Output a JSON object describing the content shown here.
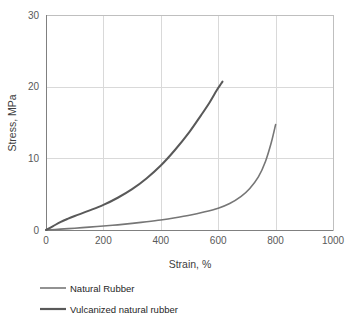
{
  "chart_data": {
    "type": "line",
    "title": "",
    "xlabel": "Strain, %",
    "ylabel": "Stress, MPa",
    "xlim": [
      0,
      1000
    ],
    "ylim": [
      0,
      30
    ],
    "xticks": [
      0,
      200,
      400,
      600,
      800,
      1000
    ],
    "yticks": [
      0,
      10,
      20,
      30
    ],
    "xtick_labels": [
      "0",
      "200",
      "400",
      "600",
      "800",
      "1000"
    ],
    "ytick_labels": [
      "0",
      "10",
      "20",
      "30"
    ],
    "grid": true,
    "legend_position": "below",
    "series": [
      {
        "name": "Natural Rubber",
        "color": "#767676",
        "width": 1.6,
        "x": [
          0,
          50,
          100,
          150,
          200,
          250,
          300,
          350,
          400,
          450,
          500,
          550,
          600,
          640,
          680,
          710,
          740,
          765,
          785,
          800
        ],
        "y": [
          0,
          0.12,
          0.25,
          0.4,
          0.55,
          0.72,
          0.92,
          1.15,
          1.4,
          1.7,
          2.05,
          2.5,
          3.05,
          3.7,
          4.7,
          5.8,
          7.4,
          9.6,
          12.2,
          14.7
        ]
      },
      {
        "name": "Vulcanized natural rubber",
        "color": "#595959",
        "width": 2.0,
        "x": [
          0,
          25,
          50,
          75,
          100,
          150,
          200,
          250,
          300,
          350,
          400,
          450,
          500,
          540,
          570,
          595,
          610,
          615
        ],
        "y": [
          0,
          0.55,
          1.1,
          1.55,
          1.95,
          2.7,
          3.5,
          4.5,
          5.7,
          7.2,
          9.0,
          11.2,
          13.7,
          16.0,
          17.8,
          19.5,
          20.4,
          20.7
        ]
      }
    ],
    "legend": [
      {
        "label": "Natural Rubber",
        "color": "#767676",
        "width": 1.6
      },
      {
        "label": "Vulcanized natural rubber",
        "color": "#595959",
        "width": 2.2
      }
    ],
    "geometry": {
      "plot_left": 46,
      "plot_right": 333,
      "plot_top": 15,
      "plot_bottom": 230
    }
  }
}
